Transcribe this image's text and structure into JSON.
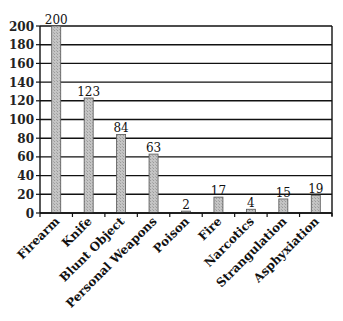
{
  "chart_data": {
    "type": "bar",
    "title": "",
    "xlabel": "",
    "ylabel": "",
    "categories": [
      "Firearm",
      "Knife",
      "Blunt Object",
      "Personal Weapons",
      "Poison",
      "Fire",
      "Narcotics",
      "Strangulation",
      "Asphyxiation"
    ],
    "values": [
      200,
      123,
      84,
      63,
      2,
      17,
      4,
      15,
      19
    ],
    "data_labels": [
      "200",
      "123",
      "84",
      "63",
      "2",
      "17",
      "4",
      "15",
      "19"
    ],
    "ylim": [
      0,
      200
    ],
    "yticks": [
      0,
      20,
      40,
      60,
      80,
      100,
      120,
      140,
      160,
      180,
      200
    ],
    "grid": true,
    "legend": null,
    "bar_color": "#bdbdbd",
    "bar_edge_color": "#555555",
    "grid_color": "#111111"
  }
}
